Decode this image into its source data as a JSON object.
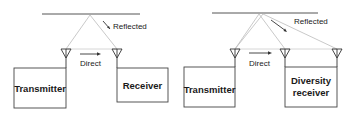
{
  "figure": {
    "left_panel": {
      "transmitter_label": "Transmitter",
      "receiver_label": "Receiver",
      "direct_label": "Direct",
      "reflected_label": "Reflected"
    },
    "right_panel": {
      "transmitter_label": "Transmitter",
      "receiver_label_line1": "Diversity",
      "receiver_label_line2": "receiver",
      "direct_label": "Direct",
      "reflected_label": "Reflected"
    },
    "colors": {
      "line": "#333333",
      "path": "#b5b5b5",
      "text": "#1a1a1a"
    }
  }
}
